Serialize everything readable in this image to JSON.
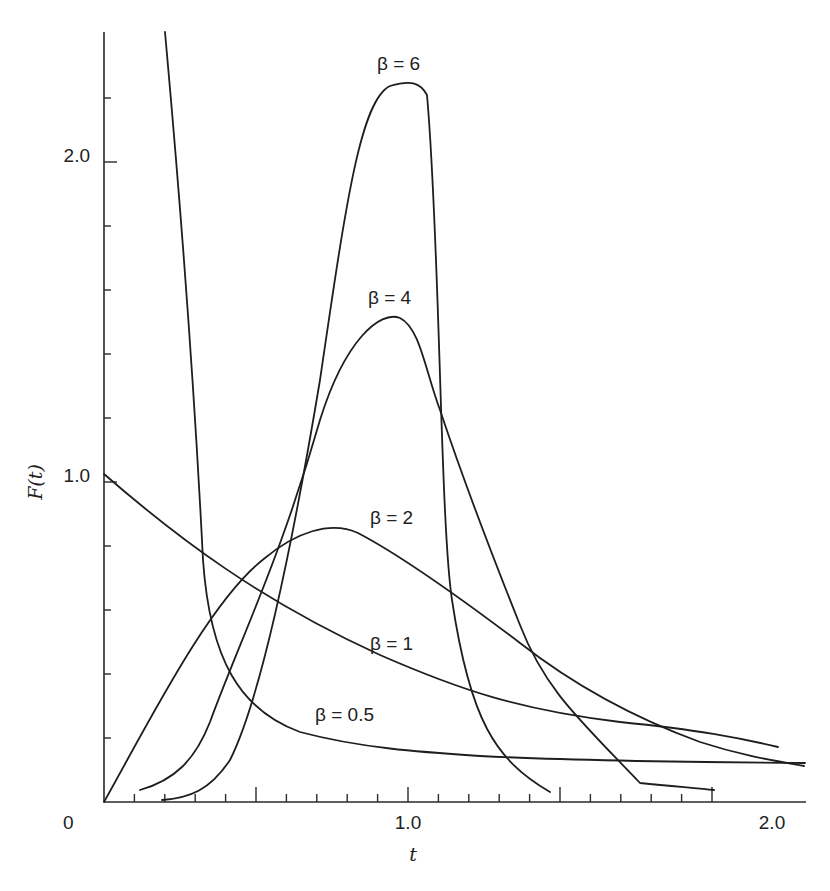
{
  "chart_data": {
    "type": "line",
    "title": "",
    "xlabel": "t",
    "ylabel": "F(t)",
    "xlim": [
      0,
      2.05
    ],
    "ylim": [
      0,
      2.35
    ],
    "grid": false,
    "legend": "inline labels",
    "x_ticks": {
      "major": [
        0.5,
        1.0,
        1.5,
        2.0
      ],
      "minor_step": 0.1,
      "labels": [
        "0",
        "1.0",
        "2.0"
      ]
    },
    "y_ticks": {
      "minor_step": 0.2,
      "labels": [
        "1.0",
        "2.0"
      ]
    },
    "series": [
      {
        "name": "β = 0.5",
        "label_pos": [
          0.5,
          0.2
        ],
        "points": [
          [
            0.2,
            2.4
          ],
          [
            0.25,
            1.6
          ],
          [
            0.3,
            1.1
          ],
          [
            0.33,
            0.65
          ],
          [
            0.4,
            0.5
          ],
          [
            0.5,
            0.37
          ],
          [
            0.6,
            0.29
          ],
          [
            0.7,
            0.24
          ],
          [
            0.8,
            0.21
          ],
          [
            1.0,
            0.17
          ],
          [
            1.2,
            0.15
          ],
          [
            1.5,
            0.14
          ],
          [
            2.0,
            0.13
          ]
        ]
      },
      {
        "name": "β = 1",
        "label_pos": [
          1.0,
          0.48
        ],
        "points": [
          [
            0,
            1.0
          ],
          [
            0.2,
            0.83
          ],
          [
            0.4,
            0.68
          ],
          [
            0.6,
            0.55
          ],
          [
            0.8,
            0.45
          ],
          [
            1.0,
            0.37
          ],
          [
            1.2,
            0.3
          ],
          [
            1.4,
            0.25
          ],
          [
            1.6,
            0.22
          ],
          [
            1.8,
            0.19
          ],
          [
            2.0,
            0.14
          ]
        ]
      },
      {
        "name": "β = 2",
        "label_pos": [
          1.0,
          0.82
        ],
        "points": [
          [
            0,
            0
          ],
          [
            0.1,
            0.2
          ],
          [
            0.2,
            0.38
          ],
          [
            0.3,
            0.53
          ],
          [
            0.4,
            0.66
          ],
          [
            0.5,
            0.76
          ],
          [
            0.6,
            0.82
          ],
          [
            0.7,
            0.84
          ],
          [
            0.8,
            0.83
          ],
          [
            0.9,
            0.78
          ],
          [
            1.0,
            0.7
          ],
          [
            1.2,
            0.54
          ],
          [
            1.4,
            0.39
          ],
          [
            1.6,
            0.27
          ],
          [
            1.8,
            0.17
          ],
          [
            2.0,
            0.06
          ]
        ]
      },
      {
        "name": "β = 4",
        "label_pos": [
          0.95,
          1.55
        ],
        "points": [
          [
            0.12,
            0.04
          ],
          [
            0.2,
            0.07
          ],
          [
            0.3,
            0.15
          ],
          [
            0.4,
            0.35
          ],
          [
            0.5,
            0.6
          ],
          [
            0.6,
            0.9
          ],
          [
            0.7,
            1.2
          ],
          [
            0.8,
            1.43
          ],
          [
            0.9,
            1.5
          ],
          [
            1.0,
            1.3
          ],
          [
            1.1,
            1.0
          ],
          [
            1.2,
            0.65
          ],
          [
            1.3,
            0.35
          ],
          [
            1.4,
            0.18
          ],
          [
            1.6,
            0.07
          ],
          [
            1.8,
            0.04
          ]
        ]
      },
      {
        "name": "β = 6",
        "label_pos": [
          1.0,
          2.35
        ],
        "points": [
          [
            0.2,
            0.02
          ],
          [
            0.3,
            0.07
          ],
          [
            0.4,
            0.18
          ],
          [
            0.5,
            0.45
          ],
          [
            0.6,
            0.85
          ],
          [
            0.7,
            1.35
          ],
          [
            0.8,
            1.85
          ],
          [
            0.9,
            2.18
          ],
          [
            1.0,
            2.23
          ],
          [
            1.1,
            2.05
          ],
          [
            1.15,
            0.9
          ],
          [
            1.2,
            0.35
          ],
          [
            1.3,
            0.12
          ],
          [
            1.4,
            0.04
          ]
        ]
      }
    ]
  },
  "render": {
    "axis_origin_px": [
      104,
      802
    ],
    "y_axis_top_px": 32,
    "x_axis_right_px": 806,
    "y_unit_px": 320,
    "x_unit_px": 304,
    "curves_px": [
      {
        "name": "beta-0.5",
        "d": "M165,32 C170,90 190,300 203,560 C210,660 240,710 300,732 C360,748 420,752 480,756 C560,760 660,762 805,763"
      },
      {
        "name": "beta-1",
        "d": "M104,474 C180,540 260,600 380,655 C460,690 520,710 620,722 C700,730 740,738 778,747"
      },
      {
        "name": "beta-2",
        "d": "M104,802 C150,720 210,600 265,558 C295,533 330,520 358,533 C400,555 450,590 520,643 C580,690 640,720 700,742 C740,755 770,760 804,766"
      },
      {
        "name": "beta-4",
        "d": "M140,790 C175,780 195,760 210,722 C240,640 280,560 320,420 C345,340 380,310 400,318 C420,328 425,370 440,410 C460,470 490,550 520,625 C545,690 580,720 640,783 C680,787 700,788 714,790"
      },
      {
        "name": "beta-6",
        "d": "M162,800 C190,798 210,790 230,760 C260,700 290,560 320,380 C345,210 360,100 390,86 C410,80 420,82 427,95 C440,240 440,520 452,600 C470,720 495,760 550,792"
      }
    ],
    "series_labels_px": [
      {
        "text": "β = 0.5",
        "x": 315,
        "y": 721
      },
      {
        "text": "β = 1",
        "x": 370,
        "y": 650
      },
      {
        "text": "β = 2",
        "x": 370,
        "y": 524
      },
      {
        "text": "β = 4",
        "x": 368,
        "y": 304
      },
      {
        "text": "β = 6",
        "x": 377,
        "y": 70
      }
    ],
    "tick_labels_px": [
      {
        "text": "2.0",
        "x": 90,
        "y": 162,
        "anchor": "end"
      },
      {
        "text": "1.0",
        "x": 90,
        "y": 482,
        "anchor": "end"
      },
      {
        "text": "0",
        "x": 63,
        "y": 829,
        "anchor": "start"
      },
      {
        "text": "1.0",
        "x": 408,
        "y": 829,
        "anchor": "middle"
      },
      {
        "text": "2.0",
        "x": 772,
        "y": 829,
        "anchor": "middle"
      }
    ],
    "axis_titles_px": {
      "y": {
        "text": "F(t)",
        "x": 42,
        "y": 482
      },
      "x": {
        "text": "t",
        "x": 413,
        "y": 861
      }
    },
    "line_color": "#1e1e1e"
  }
}
